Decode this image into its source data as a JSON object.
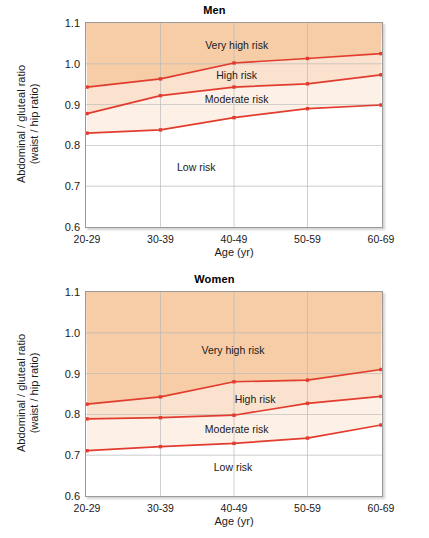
{
  "figure": {
    "background": "#ffffff",
    "line_color": "#e23c2e",
    "zone_colors": {
      "very_high": "#f6cda7",
      "high": "#fae2ce",
      "moderate": "#fdf1e7",
      "low": "#ffffff"
    },
    "axis_color": "#9a9a9a",
    "grid_color": "#b9b9b9"
  },
  "chart_data": [
    {
      "type": "line",
      "title": "Men",
      "xlabel": "Age (yr)",
      "ylabel": "Abdominal / gluteal ratio\n(waist / hip ratio)",
      "ylabel_line1": "Abdominal / gluteal ratio",
      "ylabel_line2": "(waist / hip ratio)",
      "categories": [
        "20-29",
        "30-39",
        "40-49",
        "50-59",
        "60-69"
      ],
      "x": [
        0,
        1,
        2,
        3,
        4
      ],
      "ylim": [
        0.6,
        1.1
      ],
      "yticks": [
        0.6,
        0.7,
        0.8,
        0.9,
        1.0,
        1.1
      ],
      "ytick_labels": [
        "0.6",
        "0.7",
        "0.8",
        "0.9",
        "1.0",
        "1.1"
      ],
      "grid": "horizontal-and-vertical",
      "legend": "none",
      "series": [
        {
          "name": "Very high risk / High risk boundary",
          "values": [
            0.943,
            0.963,
            1.002,
            1.013,
            1.025
          ]
        },
        {
          "name": "High risk / Moderate risk boundary",
          "values": [
            0.878,
            0.922,
            0.943,
            0.951,
            0.973
          ]
        },
        {
          "name": "Moderate risk / Low risk boundary",
          "values": [
            0.83,
            0.838,
            0.868,
            0.89,
            0.899
          ]
        }
      ],
      "zones": [
        {
          "label": "Very high risk",
          "label_x": 2.05,
          "label_y": 1.047
        },
        {
          "label": "High risk",
          "label_x": 2.05,
          "label_y": 0.972
        },
        {
          "label": "Moderate risk",
          "label_x": 2.05,
          "label_y": 0.914
        },
        {
          "label": "Low risk",
          "label_x": 1.5,
          "label_y": 0.748
        }
      ]
    },
    {
      "type": "line",
      "title": "Women",
      "xlabel": "Age (yr)",
      "ylabel": "Abdominal / gluteal ratio\n(waist / hip ratio)",
      "ylabel_line1": "Abdominal / gluteal ratio",
      "ylabel_line2": "(waist / hip ratio)",
      "categories": [
        "20-29",
        "30-39",
        "40-49",
        "50-59",
        "60-69"
      ],
      "x": [
        0,
        1,
        2,
        3,
        4
      ],
      "ylim": [
        0.6,
        1.1
      ],
      "yticks": [
        0.6,
        0.7,
        0.8,
        0.9,
        1.0,
        1.1
      ],
      "ytick_labels": [
        "0.6",
        "0.7",
        "0.8",
        "0.9",
        "1.0",
        "1.1"
      ],
      "grid": "horizontal-and-vertical",
      "legend": "none",
      "series": [
        {
          "name": "Very high risk / High risk boundary",
          "values": [
            0.825,
            0.843,
            0.88,
            0.884,
            0.91
          ]
        },
        {
          "name": "High risk / Moderate risk boundary",
          "values": [
            0.789,
            0.792,
            0.798,
            0.827,
            0.844
          ]
        },
        {
          "name": "Moderate risk / Low risk boundary",
          "values": [
            0.711,
            0.721,
            0.729,
            0.742,
            0.774
          ]
        }
      ],
      "zones": [
        {
          "label": "Very high risk",
          "label_x": 2.0,
          "label_y": 0.958
        },
        {
          "label": "High risk",
          "label_x": 2.3,
          "label_y": 0.838
        },
        {
          "label": "Moderate risk",
          "label_x": 2.05,
          "label_y": 0.763
        },
        {
          "label": "Low risk",
          "label_x": 2.0,
          "label_y": 0.672
        }
      ]
    }
  ]
}
